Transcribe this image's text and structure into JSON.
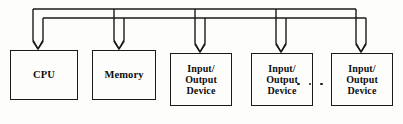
{
  "diagram": {
    "bus": {
      "line_count": 2,
      "line_color": "#1a1a1a",
      "top_line_y": 9,
      "second_line_y": 18,
      "left_x": 30,
      "right_x": 376,
      "arrow_label": "downward-arrow"
    },
    "ellipsis": {
      "text": "· · ·",
      "dot_count": 3
    },
    "nodes": [
      {
        "id": "cpu",
        "label": "CPU",
        "x": 10,
        "y": 50,
        "width": 68,
        "height": 50,
        "size_class": ""
      },
      {
        "id": "memory",
        "label": "Memory",
        "x": 92,
        "y": 50,
        "width": 64,
        "height": 50,
        "size_class": ""
      },
      {
        "id": "io-device-1",
        "label": "Input/\nOutput\nDevice",
        "x": 170,
        "y": 53,
        "width": 62,
        "height": 53,
        "size_class": "small"
      },
      {
        "id": "io-device-2",
        "label": "Input/\nOutput\nDevice",
        "x": 251,
        "y": 53,
        "width": 62,
        "height": 53,
        "size_class": "small"
      },
      {
        "id": "io-device-3",
        "label": "Input/\nOutput\nDevice",
        "x": 331,
        "y": 53,
        "width": 62,
        "height": 53,
        "size_class": "small"
      }
    ],
    "arrows": [
      {
        "id": "arrow-cpu",
        "x": 38,
        "target": "cpu"
      },
      {
        "id": "arrow-memory",
        "x": 119,
        "target": "memory"
      },
      {
        "id": "arrow-io-1",
        "x": 200,
        "target": "io-device-1"
      },
      {
        "id": "arrow-io-2",
        "x": 281,
        "target": "io-device-2"
      },
      {
        "id": "arrow-io-3",
        "x": 361,
        "target": "io-device-3"
      }
    ]
  }
}
